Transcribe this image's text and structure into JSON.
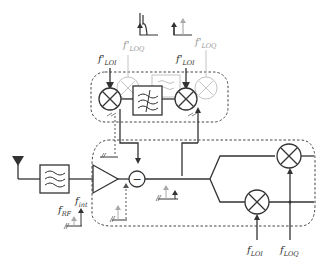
{
  "diagram": {
    "type": "rf-receiver-block-diagram",
    "labels": {
      "lo_i_top_left": "f'",
      "lo_i_top_left_sub": "LOI",
      "lo_q_top_left": "f'",
      "lo_q_top_left_sub": "LOQ",
      "lo_i_top_right": "f'",
      "lo_i_top_right_sub": "LOI",
      "lo_q_top_right": "f'",
      "lo_q_top_right_sub": "LOQ",
      "rf": "f",
      "rf_sub": "RF",
      "int": "f",
      "int_sub": "int",
      "lo_i_bottom": "f",
      "lo_i_bottom_sub": "LOI",
      "lo_q_bottom": "f",
      "lo_q_bottom_sub": "LOQ",
      "subtractor": "−"
    },
    "blocks": [
      "antenna",
      "bandpass-filter",
      "lna",
      "subtractor",
      "mixer-i",
      "mixer-q",
      "cancellation-mixer-1",
      "lowpass-filter",
      "cancellation-mixer-2"
    ],
    "colors": {
      "stroke": "#333333",
      "faint": "#b5b5b5",
      "dashed": "#555555",
      "grey_arrow": "#9a9a9a"
    }
  }
}
